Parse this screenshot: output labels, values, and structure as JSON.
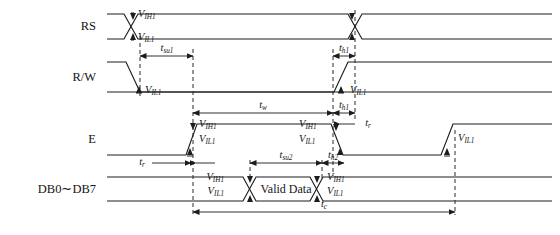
{
  "figure": {
    "kind": "timing-diagram",
    "background_color": "#ffffff",
    "line_color": "#1c1c1c",
    "width": 560,
    "height": 235
  },
  "signals": {
    "rs": {
      "name": "RS"
    },
    "rw": {
      "name": "R/W"
    },
    "e": {
      "name": "E"
    },
    "db": {
      "name": "DB0∼DB7"
    }
  },
  "levels": {
    "vih1": "V",
    "vih1_sub": "IH1",
    "vil1": "V",
    "vil1_sub": "IL1"
  },
  "level_labels": {
    "rs_vih1": "V",
    "rs_vih1_sub": "IH1",
    "rs_vil1": "V",
    "rs_vil1_sub": "IL1",
    "rw_vil1": "V",
    "rw_vil1_sub": "IL1",
    "rw_right_vil1": "V",
    "rw_right_vil1_sub": "IL1",
    "e_rise_vih1": "V",
    "e_rise_vih1_sub": "IH1",
    "e_rise_vil1": "V",
    "e_rise_vil1_sub": "IL1",
    "e_fall_vih1": "V",
    "e_fall_vih1_sub": "IH1",
    "e_fall_vil1": "V",
    "e_fall_vil1_sub": "IL1",
    "e_end_vil1": "V",
    "e_end_vil1_sub": "IL1",
    "db_open_vih1": "V",
    "db_open_vih1_sub": "IH1",
    "db_open_vil1": "V",
    "db_open_vil1_sub": "IL1",
    "db_close_vih1": "V",
    "db_close_vih1_sub": "IH1",
    "db_close_vil1": "V",
    "db_close_vil1_sub": "IL1"
  },
  "timings": {
    "tsu1": "t",
    "tsu1_sub": "su1",
    "th1_rw": "t",
    "th1_rw_sub": "h1",
    "tw": "t",
    "tw_sub": "w",
    "th1_e": "t",
    "th1_e_sub": "h1",
    "tr_e": "t",
    "tr_e_sub": "r",
    "tr_db": "t",
    "tr_db_sub": "r",
    "tsu2": "t",
    "tsu2_sub": "su2",
    "th2": "t",
    "th2_sub": "h2",
    "tc": "t",
    "tc_sub": "c"
  },
  "data_bus": {
    "valid_label": "Valid Data"
  },
  "geometry": {
    "row_rs_high_y": 14,
    "row_rs_low_y": 39,
    "row_rw_high_y": 62,
    "row_rw_low_y": 92,
    "row_e_high_y": 124,
    "row_e_low_y": 155,
    "row_db_high_y": 177,
    "row_db_low_y": 201,
    "x_start": 107,
    "x_end": 552,
    "x_rs_cross": 131,
    "x_rw_fall": 139,
    "x_dash_a": 140,
    "x_dash_b": 193,
    "x_dash_c": 333,
    "x_dash_d": 355,
    "x_dash_db_open": 250,
    "x_dash_db_close": 322,
    "x_dash_tc_end": 455
  }
}
